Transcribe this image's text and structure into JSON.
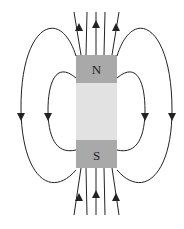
{
  "diagram": {
    "magnet": {
      "north_label": "N",
      "south_label": "S",
      "pole_color": "#a9a9a9",
      "middle_color": "#e2e2e2"
    },
    "line_color": "#222222"
  }
}
